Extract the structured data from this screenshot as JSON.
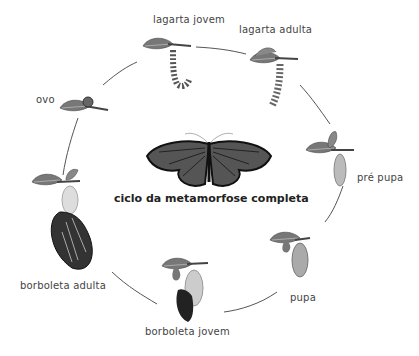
{
  "title": "ciclo da metamorfose completa",
  "stages": [
    {
      "id": "ovo",
      "label": "ovo"
    },
    {
      "id": "lagarta-jovem",
      "label": "lagarta jovem"
    },
    {
      "id": "lagarta-adulta",
      "label": "lagarta adulta"
    },
    {
      "id": "pre-pupa",
      "label": "pré pupa"
    },
    {
      "id": "pupa",
      "label": "pupa"
    },
    {
      "id": "borboleta-jovem",
      "label": "borboleta jovem"
    },
    {
      "id": "borboleta-adulta",
      "label": "borboleta adulta"
    }
  ],
  "colors": {
    "line": "#555555",
    "leaf": "#6a6a6a",
    "text": "#444444"
  }
}
